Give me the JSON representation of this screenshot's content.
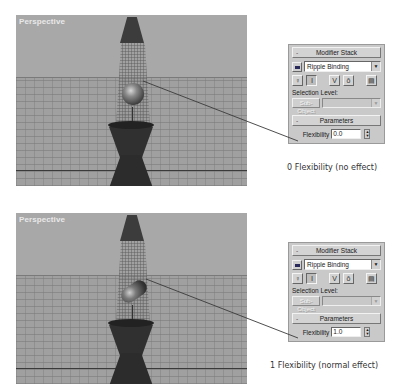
{
  "examples": [
    {
      "viewport": {
        "label": "Perspective",
        "blob_shape": "sphere"
      },
      "panel": {
        "modifier_stack": {
          "title": "Modifier Stack",
          "collapse_symbol": "-",
          "selected_modifier": "Ripple Binding",
          "dropdown_arrow": "▼",
          "tool_icons": [
            "pin-stack-icon",
            "active-inactive-toggle-icon",
            "show-end-result-icon",
            "make-unique-icon",
            "remove-modifier-icon",
            "edit-stack-icon"
          ],
          "selection_level_label": "Selection Level:",
          "sub_object_button": "Sub-Object",
          "sub_object_dropdown": ""
        },
        "parameters": {
          "title": "Parameters",
          "collapse_symbol": "-",
          "flexibility_label": "Flexibility",
          "flexibility_value": "0.0"
        }
      },
      "caption": "0 Flexibility (no effect)"
    },
    {
      "viewport": {
        "label": "Perspective",
        "blob_shape": "stretched-capsule"
      },
      "panel": {
        "modifier_stack": {
          "title": "Modifier Stack",
          "collapse_symbol": "-",
          "selected_modifier": "Ripple Binding",
          "dropdown_arrow": "▼",
          "tool_icons": [
            "pin-stack-icon",
            "active-inactive-toggle-icon",
            "show-end-result-icon",
            "make-unique-icon",
            "remove-modifier-icon",
            "edit-stack-icon"
          ],
          "selection_level_label": "Selection Level:",
          "sub_object_button": "Sub-Object",
          "sub_object_dropdown": ""
        },
        "parameters": {
          "title": "Parameters",
          "collapse_symbol": "-",
          "flexibility_label": "Flexibility",
          "flexibility_value": "1.0"
        }
      },
      "caption": "1 Flexibility (normal effect)"
    }
  ],
  "colors": {
    "viewport_bg": "#a4a4a4",
    "panel_bg": "#c9c9c9",
    "object_dark": "#2c2c2c",
    "label_text": "#e8e8e8"
  }
}
